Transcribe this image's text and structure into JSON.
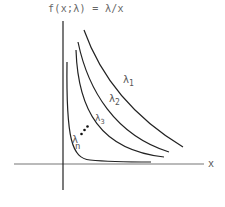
{
  "title": "f(x;λ) = λ/x",
  "axes": {
    "x_label": "x"
  },
  "curves": [
    {
      "label": "λ",
      "subscript": "1"
    },
    {
      "label": "λ",
      "subscript": "2"
    },
    {
      "label": "λ",
      "subscript": "3"
    },
    {
      "label": "λ",
      "subscript": "n"
    }
  ],
  "ellipsis": "..."
}
